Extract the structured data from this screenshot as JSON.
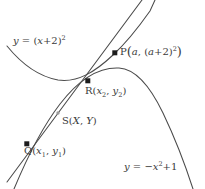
{
  "figure": {
    "width": 205,
    "height": 189,
    "background_color": "#ffffff",
    "stroke_color": "#4a4a4a",
    "text_color": "#3a3a3a"
  },
  "curves": [
    {
      "name": "upward-parabola",
      "equation": "y = (x+2)^2",
      "opens": "up",
      "vertex": [
        -2,
        0
      ],
      "label": "y = (x+2)²"
    },
    {
      "name": "downward-parabola",
      "equation": "y = -x^2 + 1",
      "opens": "down",
      "vertex": [
        0,
        1
      ],
      "label": "y = -x² + 1"
    },
    {
      "name": "secant-line",
      "description": "straight line through Q, S, R and P"
    }
  ],
  "labels": {
    "up_parabola": {
      "lhs": "y",
      "eq": " = ",
      "open_paren": "(",
      "inner": "x",
      "plus_two": "+2",
      "close_paren": ")",
      "exponent": "2",
      "full": "y = (x+2)²"
    },
    "down_parabola": {
      "lhs": "y",
      "eq": " = −",
      "var": "x",
      "exponent": "2",
      "tail": "+1",
      "full": "y = −x²+1"
    },
    "point_p": {
      "name": "P",
      "open": "(",
      "first": "a",
      "comma": ", ",
      "second_open": "(",
      "second_var": "a",
      "second_plus": "+2",
      "second_close": ")",
      "second_exp": "2",
      "close": ")",
      "full": "P(a, (a+2)²)"
    },
    "point_r": {
      "name": "R",
      "open": "(",
      "x_var": "x",
      "x_sub": "2",
      "comma": ", ",
      "y_var": "y",
      "y_sub": "2",
      "close": ")",
      "full": "R(x₂, y₂)"
    },
    "point_s": {
      "name": "S",
      "open": "(",
      "x_var": "X",
      "comma": ", ",
      "y_var": "Y",
      "close": ")",
      "full": "S(X, Y)"
    },
    "point_q": {
      "name": "Q",
      "open": "(",
      "x_var": "x",
      "x_sub": "1",
      "comma": ", ",
      "y_var": "y",
      "y_sub": "1",
      "close": ")",
      "full": "Q(x₁, y₁)"
    }
  },
  "points": [
    {
      "id": "P",
      "label": "P(a, (a+2)²)",
      "marker": "filled-square",
      "px": [
        115,
        53
      ]
    },
    {
      "id": "R",
      "label": "R(x₂, y₂)",
      "marker": "filled-square",
      "px": [
        88,
        81
      ]
    },
    {
      "id": "S",
      "label": "S(X, Y)",
      "marker": "small-dot",
      "px": [
        58,
        113
      ]
    },
    {
      "id": "Q",
      "label": "Q(x₁, y₁)",
      "marker": "filled-square",
      "px": [
        27,
        144
      ]
    }
  ]
}
